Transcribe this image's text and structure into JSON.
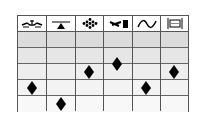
{
  "diagram": {
    "columns": [
      {
        "icon": "meandering-channel-icon"
      },
      {
        "icon": "balance-triangle-icon"
      },
      {
        "icon": "dot-cluster-icon"
      },
      {
        "icon": "arrow-block-icon"
      },
      {
        "icon": "sine-wave-icon"
      },
      {
        "icon": "bracket-frame-icon"
      }
    ],
    "row_count": 5,
    "row_colors": [
      "#dcdcdc",
      "#e6e6e6",
      "#eeeeee",
      "#f3f3f3",
      "#f8f8f8"
    ],
    "markers": [
      {
        "column": 1,
        "row_position": 3.5
      },
      {
        "column": 2,
        "row_position": 4.5
      },
      {
        "column": 3,
        "row_position": 2.5
      },
      {
        "column": 4,
        "row_position": 2.0
      },
      {
        "column": 5,
        "row_position": 3.5
      },
      {
        "column": 6,
        "row_position": 2.5
      }
    ],
    "marker_color": "#000000",
    "grid_color": "#555555"
  }
}
